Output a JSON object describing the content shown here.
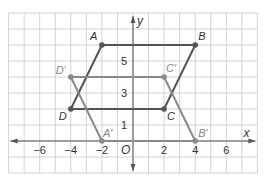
{
  "diagram": {
    "type": "coordinate-plane-translation",
    "grid": {
      "x_min": -8,
      "x_max": 8,
      "y_min": -2,
      "y_max": 8,
      "step": 1
    },
    "axes": {
      "x_label": "x",
      "y_label": "y",
      "origin_label": "O",
      "x_ticks": [
        {
          "value": -6,
          "label": "−6"
        },
        {
          "value": -4,
          "label": "−4"
        },
        {
          "value": -2,
          "label": "−2"
        },
        {
          "value": 2,
          "label": "2"
        },
        {
          "value": 4,
          "label": "4"
        },
        {
          "value": 6,
          "label": "6"
        }
      ],
      "y_ticks": [
        {
          "value": 1,
          "label": "1"
        },
        {
          "value": 3,
          "label": "3"
        },
        {
          "value": 5,
          "label": "5"
        }
      ]
    },
    "figures": [
      {
        "name": "ABCD",
        "color": "#555555",
        "points": [
          {
            "label": "A",
            "x": -2,
            "y": 6,
            "dx": -12,
            "dy": -5
          },
          {
            "label": "B",
            "x": 4,
            "y": 6,
            "dx": 3,
            "dy": -5
          },
          {
            "label": "C",
            "x": 2,
            "y": 2,
            "dx": 3,
            "dy": 11
          },
          {
            "label": "D",
            "x": -4,
            "y": 2,
            "dx": -12,
            "dy": 11
          }
        ]
      },
      {
        "name": "A'B'C'D'",
        "color": "#8a8a8a",
        "points": [
          {
            "label": "A′",
            "x": -2,
            "y": 0,
            "dx": 1,
            "dy": -4
          },
          {
            "label": "B′",
            "x": 4,
            "y": 0,
            "dx": 3,
            "dy": -4
          },
          {
            "label": "C′",
            "x": 2,
            "y": 4,
            "dx": 2,
            "dy": -5
          },
          {
            "label": "D′",
            "x": -4,
            "y": 4,
            "dx": -15,
            "dy": -3
          }
        ]
      }
    ],
    "colors": {
      "grid": "#c8c8c8",
      "axis": "#555555",
      "original": "#555555",
      "image": "#8a8a8a"
    }
  }
}
